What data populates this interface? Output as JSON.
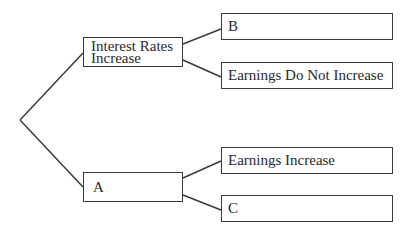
{
  "diagram": {
    "type": "decision-tree",
    "nodes": {
      "interest_rates_increase": {
        "line1": "Interest Rates",
        "line2": "Increase"
      },
      "a": {
        "label": "A"
      },
      "b": {
        "label": "B"
      },
      "earnings_do_not_increase": {
        "label": "Earnings Do Not Increase"
      },
      "earnings_increase": {
        "label": "Earnings Increase"
      },
      "c": {
        "label": "C"
      }
    },
    "edges": [
      {
        "from": "root",
        "to": "interest_rates_increase"
      },
      {
        "from": "root",
        "to": "a"
      },
      {
        "from": "interest_rates_increase",
        "to": "b"
      },
      {
        "from": "interest_rates_increase",
        "to": "earnings_do_not_increase"
      },
      {
        "from": "a",
        "to": "earnings_increase"
      },
      {
        "from": "a",
        "to": "c"
      }
    ],
    "colors": {
      "line": "#3a3a3a",
      "text": "#2a2a2a",
      "background": "#ffffff"
    }
  }
}
